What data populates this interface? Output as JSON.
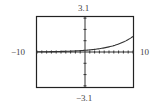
{
  "chart_data": {
    "type": "line",
    "title": "",
    "xlabel": "",
    "ylabel": "",
    "xlim": [
      -10,
      10
    ],
    "ylim": [
      -3.1,
      3.1
    ],
    "window_labels": {
      "xmin": "−10",
      "xmax": "10",
      "ymin": "−3.1",
      "ymax": "3.1"
    },
    "xscale_tick": 1,
    "yscale_tick": 1,
    "grid": false,
    "series": [
      {
        "name": "curve",
        "x": [
          -10,
          -8,
          -6,
          -4,
          -2,
          0,
          2,
          4,
          6,
          8,
          10
        ],
        "values": [
          0.02,
          0.02,
          0.03,
          0.05,
          0.1,
          0.15,
          0.23,
          0.35,
          0.55,
          0.88,
          1.38
        ]
      }
    ]
  }
}
